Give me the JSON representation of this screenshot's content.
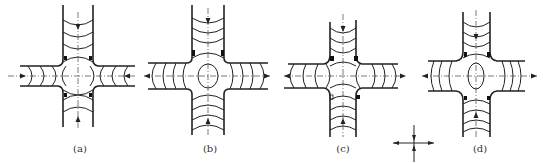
{
  "figure": {
    "panels": [
      {
        "id": "a",
        "label": "(a)",
        "flow": "inward-horizontal, inward-vertical",
        "center_feature": "none"
      },
      {
        "id": "b",
        "label": "(b)",
        "flow": "outward-horizontal, inward-vertical",
        "center_feature": "ellipse-horizontal"
      },
      {
        "id": "c",
        "label": "(c)",
        "flow": "outward-horizontal, inward-vertical",
        "center_feature": "none"
      },
      {
        "id": "d",
        "label": "(d)",
        "flow": "outward-horizontal, inward-vertical",
        "center_feature": "ellipse-vertical"
      }
    ],
    "legend": {
      "symbol": "axis-cross",
      "description": "compression vertical, tension horizontal"
    }
  },
  "colors": {
    "line": "#222222",
    "background": "#ffffff"
  }
}
